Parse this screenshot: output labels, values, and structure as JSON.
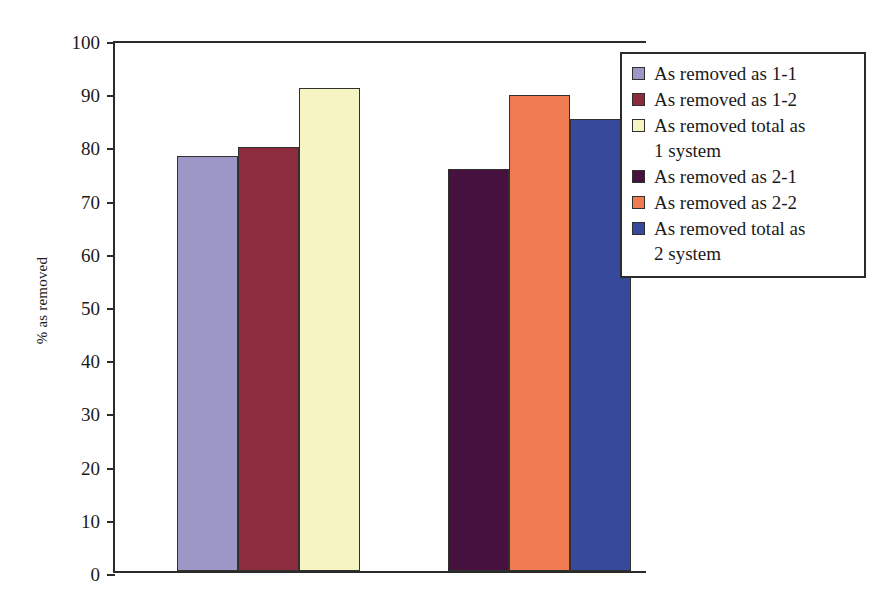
{
  "chart_data": {
    "type": "bar",
    "title": "",
    "xlabel": "",
    "ylabel": "% as removed",
    "ylim": [
      0,
      100
    ],
    "ytick_step": 10,
    "yticks": [
      100,
      90,
      80,
      70,
      60,
      50,
      40,
      30,
      20,
      10,
      0
    ],
    "grid": false,
    "legend_position": "right-top-inset",
    "categories": [
      "1 system",
      "2 system"
    ],
    "series": [
      {
        "name": "As removed as 1-1",
        "color": "#9c97c6",
        "value": 78.1,
        "group": "1 system"
      },
      {
        "name": "As removed as 1-2",
        "color": "#8c2c3e",
        "value": 79.7,
        "group": "1 system"
      },
      {
        "name": "As removed total as 1 system",
        "color": "#f7f4c4",
        "value": 90.7,
        "group": "1 system"
      },
      {
        "name": "As removed as 2-1",
        "color": "#46103f",
        "value": 75.5,
        "group": "2 system"
      },
      {
        "name": "As removed as 2-2",
        "color": "#ef7b53",
        "value": 89.4,
        "group": "2 system"
      },
      {
        "name": "As removed total as 2 system",
        "color": "#37499a",
        "value": 85.0,
        "group": "2 system"
      }
    ]
  },
  "axis": {
    "y_label": "% as removed",
    "y_ticks": [
      "100",
      "90",
      "80",
      "70",
      "60",
      "50",
      "40",
      "30",
      "20",
      "10",
      "0"
    ]
  },
  "legend": {
    "items": [
      {
        "label": "As removed as 1-1",
        "color": "#9c97c6"
      },
      {
        "label": "As removed as 1-2",
        "color": "#8c2c3e"
      },
      {
        "label": "As removed total as\n1 system",
        "color": "#f7f4c4"
      },
      {
        "label": "As removed as 2-1",
        "color": "#46103f"
      },
      {
        "label": "As removed as 2-2",
        "color": "#ef7b53"
      },
      {
        "label": "As removed total as\n2 system",
        "color": "#37499a"
      }
    ]
  }
}
